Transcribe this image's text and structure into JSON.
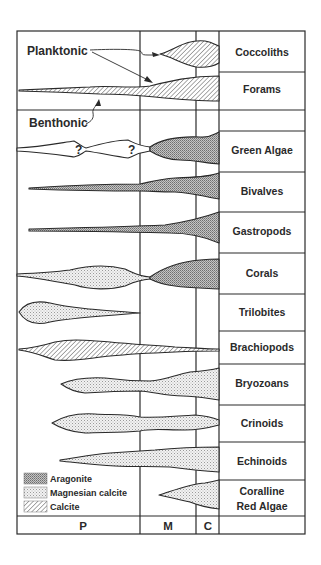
{
  "diagram": {
    "colors": {
      "line": "#2a2a2a",
      "background": "#ffffff",
      "fill_gray": "#b8b8b8"
    },
    "periods": [
      {
        "key": "P",
        "label": "P"
      },
      {
        "key": "M",
        "label": "M"
      },
      {
        "key": "C",
        "label": "C"
      }
    ],
    "taxa": [
      {
        "label": "Coccoliths",
        "mineralogy": [
          "Calcite"
        ]
      },
      {
        "label": "Forams",
        "mineralogy": [
          "Calcite"
        ]
      },
      {
        "label": "",
        "mineralogy": []
      },
      {
        "label": "Green Algae",
        "mineralogy": [
          "Unknown (?)",
          "Aragonite"
        ]
      },
      {
        "label": "Bivalves",
        "mineralogy": [
          "Aragonite"
        ]
      },
      {
        "label": "Gastropods",
        "mineralogy": [
          "Aragonite"
        ]
      },
      {
        "label": "Corals",
        "mineralogy": [
          "Magnesian calcite",
          "Aragonite"
        ]
      },
      {
        "label": "Trilobites",
        "mineralogy": [
          "Magnesian calcite"
        ]
      },
      {
        "label": "Brachiopods",
        "mineralogy": [
          "Calcite"
        ]
      },
      {
        "label": "Bryozoans",
        "mineralogy": [
          "Magnesian calcite"
        ]
      },
      {
        "label": "Crinoids",
        "mineralogy": [
          "Magnesian calcite"
        ]
      },
      {
        "label": "Echinoids",
        "mineralogy": [
          "Magnesian calcite"
        ]
      },
      {
        "label_line1": "Coralline",
        "label_line2": "Red Algae",
        "mineralogy": [
          "Magnesian calcite"
        ]
      }
    ],
    "annotations": {
      "planktonic": "Planktonic",
      "benthonic": "Benthonic",
      "question_mark": "?"
    },
    "legend": [
      {
        "pattern": "aragonite",
        "label": "Aragonite"
      },
      {
        "pattern": "mgcalcite",
        "label": "Magnesian calcite"
      },
      {
        "pattern": "calcite",
        "label": "Calcite"
      }
    ]
  }
}
